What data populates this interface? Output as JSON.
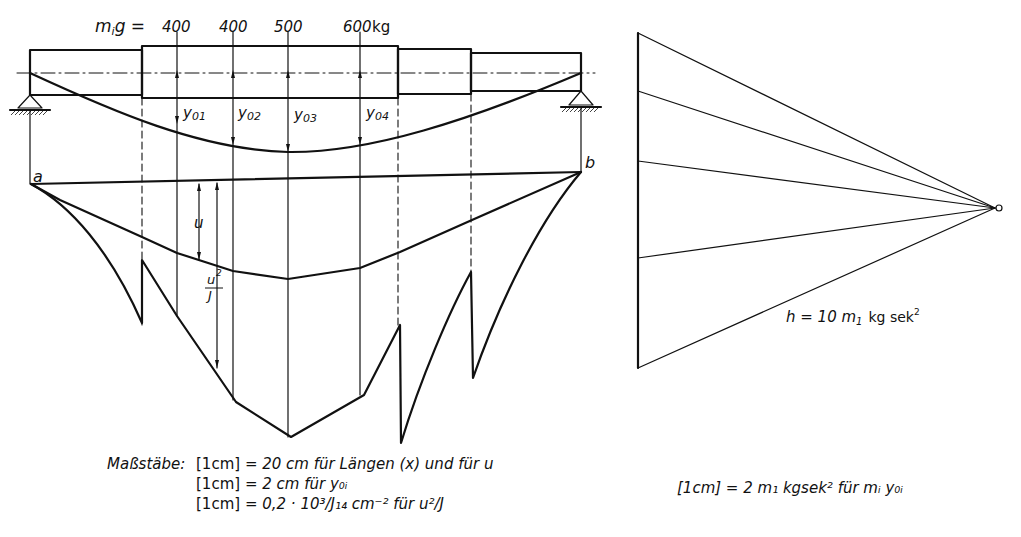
{
  "beam_diagram": {
    "load_prefix": "m",
    "load_prefix_sub": "i",
    "load_prefix_g": "g =",
    "loads": [
      "400",
      "400",
      "500",
      "600"
    ],
    "load_unit": "kg",
    "deflection_labels": [
      "y",
      "y",
      "y",
      "y"
    ],
    "deflection_subs": [
      "01",
      "02",
      "03",
      "04"
    ],
    "point_a": "a",
    "point_b": "b",
    "u_label": "u",
    "u2J_num": "u",
    "u2J_sup": "2",
    "u2J_den": "J"
  },
  "force_polygon": {
    "h_label": "h = 10 m",
    "h_sub": "1",
    "h_unit": "kg sek",
    "h_unit_sup": "2"
  },
  "scales": {
    "title": "Maßstäbe:",
    "lines": [
      {
        "lhs": "[1cm]",
        "rhs": "= 20 cm  für Längen (x) und für u"
      },
      {
        "lhs": "[1cm]",
        "rhs": "=   2 cm  für y₀ᵢ"
      },
      {
        "lhs": "[1cm]",
        "rhs": "= 0,2 · 10³/J₁₄ cm⁻² für u²/J"
      }
    ],
    "polygon_scale": "[1cm] = 2 m₁ kgsek² für mᵢ y₀ᵢ"
  }
}
